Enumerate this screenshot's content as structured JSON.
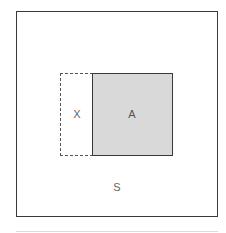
{
  "diagram": {
    "type": "set-diagram",
    "universe": {
      "label": "S",
      "border_color": "#3a3a3a",
      "fill": "#ffffff"
    },
    "sets": [
      {
        "id": "X",
        "label": "X",
        "border_style": "dashed",
        "border_color": "#555555",
        "fill": "#ffffff"
      },
      {
        "id": "A",
        "label": "A",
        "border_style": "solid",
        "border_color": "#3a3a3a",
        "fill": "#d9d9d9"
      }
    ],
    "relation": "X adjacent to A (shared edge), both inside S"
  }
}
